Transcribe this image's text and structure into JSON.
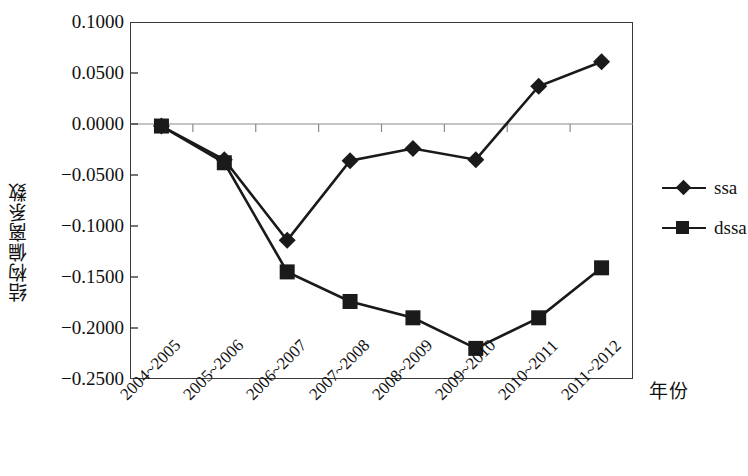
{
  "chart_data": {
    "type": "line",
    "title": "",
    "xlabel": "年份",
    "ylabel": "结构偏离系数",
    "categories": [
      "2004~2005",
      "2005~2006",
      "2006~2007",
      "2007~2008",
      "2008~2009",
      "2009~2010",
      "2010~2011",
      "2011~2012"
    ],
    "series": [
      {
        "name": "ssa",
        "marker": "diamond",
        "color": "#1a1a1a",
        "values": [
          -0.002,
          -0.035,
          -0.114,
          -0.036,
          -0.024,
          -0.035,
          0.037,
          0.061
        ]
      },
      {
        "name": "dssa",
        "marker": "square",
        "color": "#1a1a1a",
        "values": [
          -0.002,
          -0.038,
          -0.145,
          -0.174,
          -0.19,
          -0.22,
          -0.19,
          -0.141
        ]
      }
    ],
    "ylim": [
      -0.25,
      0.1
    ],
    "ytick_values": [
      0.1,
      0.05,
      0.0,
      -0.05,
      -0.1,
      -0.15,
      -0.2,
      -0.25
    ],
    "ytick_labels": [
      "0.1000",
      "0.0500",
      "0.0000",
      "-0.0500",
      "-0.1000",
      "-0.1500",
      "-0.2000",
      "-0.2500"
    ],
    "grid": false,
    "zero_line": true,
    "legend_position": "right"
  },
  "legend": {
    "entries": [
      {
        "label": "ssa"
      },
      {
        "label": "dssa"
      }
    ]
  },
  "axis": {
    "y_title": "结构偏离系数",
    "x_title": "年份"
  }
}
